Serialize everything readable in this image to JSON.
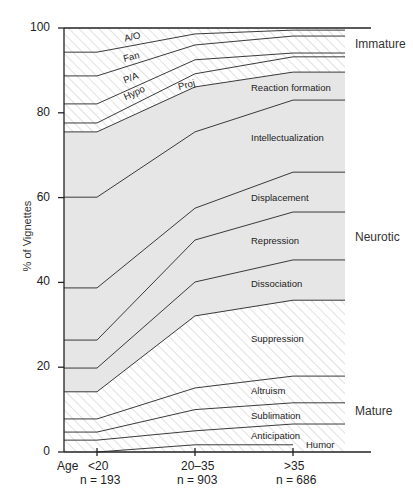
{
  "chart_data": {
    "type": "area",
    "title": "",
    "xlabel": "Age",
    "ylabel": "% of Vignettes",
    "ylim": [
      0,
      100
    ],
    "yticks": [
      0,
      20,
      40,
      60,
      80,
      100
    ],
    "categories": [
      "<20",
      "20–35",
      ">35"
    ],
    "sample_sizes": [
      "n = 193",
      "n = 903",
      "n = 686"
    ],
    "stacked": true,
    "boundaries_note": "cumulative upper boundary of each layer, bottom to top",
    "series": [
      {
        "name": "Humor",
        "group": "Mature",
        "cumulative": [
          0,
          1.7,
          1.7
        ],
        "values": [
          0,
          1.7,
          1.7
        ]
      },
      {
        "name": "Anticipation",
        "group": "Mature",
        "cumulative": [
          2.8,
          5.0,
          6.6
        ],
        "values": [
          2.8,
          3.3,
          4.9
        ]
      },
      {
        "name": "Sublimation",
        "group": "Mature",
        "cumulative": [
          4.7,
          10.0,
          11.6
        ],
        "values": [
          1.9,
          5.0,
          5.0
        ]
      },
      {
        "name": "Altruism",
        "group": "Mature",
        "cumulative": [
          7.8,
          15.1,
          17.9
        ],
        "values": [
          3.1,
          5.1,
          6.3
        ]
      },
      {
        "name": "Suppression",
        "group": "Mature",
        "cumulative": [
          14.2,
          32.1,
          35.8
        ],
        "values": [
          6.4,
          17.0,
          17.9
        ]
      },
      {
        "name": "Dissociation",
        "group": "Neurotic",
        "cumulative": [
          19.8,
          40.1,
          45.3
        ],
        "values": [
          5.6,
          8.0,
          9.5
        ]
      },
      {
        "name": "Repression",
        "group": "Neurotic",
        "cumulative": [
          26.4,
          50.0,
          56.6
        ],
        "values": [
          6.6,
          9.9,
          11.3
        ]
      },
      {
        "name": "Displacement",
        "group": "Neurotic",
        "cumulative": [
          38.7,
          57.5,
          66.0
        ],
        "values": [
          12.3,
          7.5,
          9.4
        ]
      },
      {
        "name": "Intellectualization",
        "group": "Neurotic",
        "cumulative": [
          60.1,
          75.5,
          83.0
        ],
        "values": [
          21.4,
          18.0,
          17.0
        ]
      },
      {
        "name": "Reaction formation",
        "group": "Neurotic",
        "cumulative": [
          75.5,
          86.1,
          89.6
        ],
        "values": [
          15.4,
          10.6,
          6.6
        ]
      },
      {
        "name": "Proj",
        "group": "Immature",
        "cumulative": [
          77.6,
          89.2,
          93.2
        ],
        "values": [
          2.1,
          3.1,
          3.6
        ]
      },
      {
        "name": "Hypo",
        "group": "Immature",
        "cumulative": [
          82.1,
          92.5,
          94.1
        ],
        "values": [
          4.5,
          3.3,
          0.9
        ]
      },
      {
        "name": "P/A",
        "group": "Immature",
        "cumulative": [
          88.7,
          96.0,
          98.1
        ],
        "values": [
          6.6,
          3.5,
          4.0
        ]
      },
      {
        "name": "Fan",
        "group": "Immature",
        "cumulative": [
          94.3,
          98.6,
          99.5
        ],
        "values": [
          5.6,
          2.6,
          1.4
        ]
      },
      {
        "name": "A/O",
        "group": "Immature",
        "cumulative": [
          100,
          100,
          100
        ],
        "values": [
          5.7,
          1.4,
          0.5
        ]
      }
    ],
    "groups": [
      {
        "name": "Immature",
        "fill": "hatched"
      },
      {
        "name": "Neurotic",
        "fill": "grey"
      },
      {
        "name": "Mature",
        "fill": "hatched"
      }
    ],
    "grid": false,
    "legend_position": "right (group labels)"
  },
  "labels": {
    "ylabel": "% of Vignettes",
    "xprefix": "Age",
    "yticks": [
      "100",
      "80",
      "60",
      "40",
      "20",
      "0"
    ],
    "categories": [
      "<20",
      "20–35",
      ">35"
    ],
    "ns": [
      "n = 193",
      "n = 903",
      "n = 686"
    ],
    "groups": {
      "immature": "Immature",
      "neurotic": "Neurotic",
      "mature": "Mature"
    },
    "layers": {
      "ao": "A/O",
      "fan": "Fan",
      "pa": "P/A",
      "hypo": "Hypo",
      "proj": "Proj",
      "reaction": "Reaction formation",
      "intellect": "Intellectualization",
      "displacement": "Displacement",
      "repression": "Repression",
      "dissociation": "Dissociation",
      "suppression": "Suppression",
      "altruism": "Altruism",
      "sublimation": "Sublimation",
      "anticipation": "Anticipation",
      "humor": "Humor"
    }
  },
  "colors": {
    "neurotic_fill": "#e6e6e6",
    "hatch_line": "#d4d4d4",
    "line": "#3a3a3a",
    "axis": "#222222"
  }
}
